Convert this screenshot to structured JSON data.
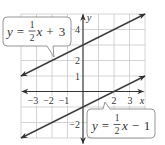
{
  "chart_data": {
    "type": "line",
    "title": "",
    "xlabel": "x",
    "ylabel": "y",
    "xlim": [
      -4,
      4
    ],
    "ylim": [
      -3,
      5
    ],
    "grid": true,
    "legend": "callout labels",
    "x_tick_labels_shown": [
      -3,
      -2,
      -1,
      2,
      3
    ],
    "y_tick_labels_shown": [
      4,
      2,
      1,
      -2
    ],
    "series": [
      {
        "name": "y = 1/2x + 3",
        "slope": 0.5,
        "intercept": 3,
        "x": [
          -4,
          4
        ],
        "y": [
          1,
          5
        ]
      },
      {
        "name": "y = 1/2x − 1",
        "slope": 0.5,
        "intercept": -1,
        "x": [
          -4,
          4
        ],
        "y": [
          -3,
          1
        ]
      }
    ],
    "annotations": [
      {
        "text": "y = 1/2x + 3",
        "position": "upper-left",
        "points_to": "series 0"
      },
      {
        "text": "y = 1/2x − 1",
        "position": "lower-right",
        "points_to": "series 1"
      }
    ]
  },
  "axes": {
    "x_label": "x",
    "y_label": "y",
    "x_tick_labels": [
      "−3",
      "−2",
      "−1",
      "2",
      "3"
    ],
    "y_tick_labels": [
      "4",
      "2",
      "1",
      "−2"
    ]
  },
  "labels": {
    "upper": {
      "lhs": "y",
      "eq": "=",
      "num": "1",
      "den": "2",
      "var": "x",
      "op": "+",
      "const": "3"
    },
    "lower": {
      "lhs": "y",
      "eq": "=",
      "num": "1",
      "den": "2",
      "var": "x",
      "op": "−",
      "const": "1"
    }
  },
  "colors": {
    "line": "#3d3d3d",
    "grid": "#c9c9c9",
    "callout_border": "#8a8a8a"
  }
}
